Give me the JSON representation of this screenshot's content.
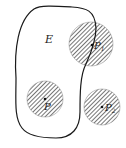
{
  "figure": {
    "region_label": "E",
    "points": [
      {
        "id": "P1",
        "label": "P",
        "subscript": "1",
        "cx": 91,
        "cy": 44,
        "r": 22,
        "relation": "boundary"
      },
      {
        "id": "P",
        "label": "P",
        "subscript": "",
        "cx": 45,
        "cy": 99,
        "r": 18,
        "relation": "interior"
      },
      {
        "id": "P2",
        "label": "P",
        "subscript": "2",
        "cx": 102,
        "cy": 107,
        "r": 18,
        "relation": "exterior"
      }
    ],
    "colors": {
      "line": "#1a1a1a",
      "hatch": "#3a3a3a",
      "fill": "#ffffff"
    }
  }
}
